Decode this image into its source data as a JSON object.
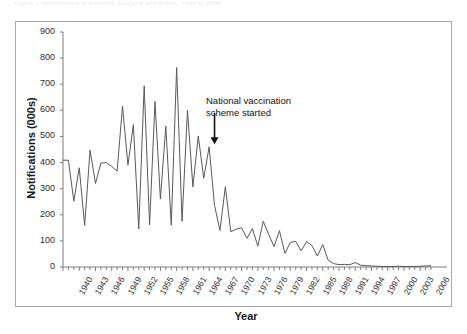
{
  "figure": {
    "caption_strip": "Figure 1  Notifications of measles, England and Wales, 1940 to 2008",
    "frame_border_color": "#a9a9a9",
    "line_color": "#595959",
    "text_color": "#1a1a1a"
  },
  "annotation": {
    "line1": "National vaccination",
    "line2": "scheme started",
    "arrow_glyph": "down-arrow",
    "arrow_year": 1968
  },
  "axes": {
    "ylabel": "Notifications (000s)",
    "xlabel": "Year",
    "y_ticks": [
      0,
      100,
      200,
      300,
      400,
      500,
      600,
      700,
      800,
      900
    ],
    "x_ticks": [
      1940,
      1943,
      1946,
      1949,
      1952,
      1955,
      1958,
      1961,
      1964,
      1967,
      1970,
      1973,
      1976,
      1979,
      1982,
      1985,
      1988,
      1991,
      1994,
      1997,
      2000,
      2003,
      2006
    ]
  },
  "chart_data": {
    "type": "line",
    "title": "",
    "xlabel": "Year",
    "ylabel": "Notifications (000s)",
    "xlim": [
      1940,
      2008
    ],
    "ylim": [
      0,
      900
    ],
    "grid": false,
    "legend": null,
    "annotations": [
      {
        "text": "National vaccination scheme started",
        "x": 1968,
        "y": 560,
        "arrow": "down"
      }
    ],
    "series": [
      {
        "name": "Measles notifications (000s)",
        "x": [
          1940,
          1941,
          1942,
          1943,
          1944,
          1945,
          1946,
          1947,
          1948,
          1949,
          1950,
          1951,
          1952,
          1953,
          1954,
          1955,
          1956,
          1957,
          1958,
          1959,
          1960,
          1961,
          1962,
          1963,
          1964,
          1965,
          1966,
          1967,
          1968,
          1969,
          1970,
          1971,
          1972,
          1973,
          1974,
          1975,
          1976,
          1977,
          1978,
          1979,
          1980,
          1981,
          1982,
          1983,
          1984,
          1985,
          1986,
          1987,
          1988,
          1989,
          1990,
          1991,
          1992,
          1993,
          1994,
          1995,
          1996,
          1997,
          1998,
          1999,
          2000,
          2001,
          2002,
          2003,
          2004,
          2005,
          2006,
          2007,
          2008
        ],
        "values": [
          409,
          409,
          252,
          380,
          159,
          447,
          320,
          398,
          400,
          385,
          367,
          616,
          390,
          545,
          146,
          694,
          161,
          634,
          260,
          540,
          160,
          764,
          175,
          601,
          307,
          502,
          340,
          460,
          236,
          140,
          307,
          135,
          145,
          150,
          110,
          147,
          80,
          175,
          125,
          78,
          139,
          52,
          94,
          98,
          62,
          97,
          82,
          42,
          86,
          26,
          13,
          9,
          10,
          9,
          17,
          7,
          5,
          4,
          3,
          2,
          2,
          2,
          3,
          2,
          2,
          2,
          3,
          4,
          5
        ]
      }
    ]
  }
}
